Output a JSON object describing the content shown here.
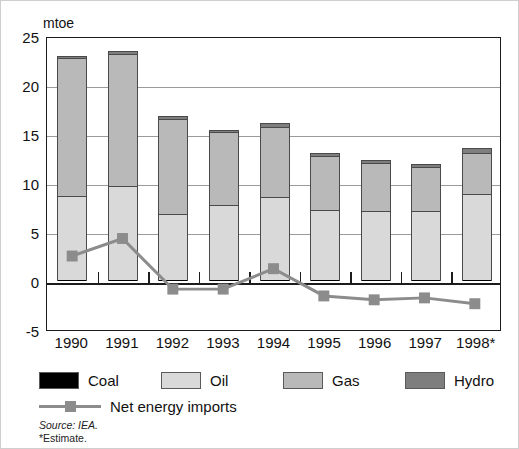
{
  "chart_data": {
    "type": "bar",
    "title": "",
    "subtitle": "",
    "xlabel": "",
    "ylabel": "mtoe",
    "ylim": [
      -5,
      25
    ],
    "yticks": [
      -5,
      0,
      5,
      10,
      15,
      20,
      25
    ],
    "grid": true,
    "stacked": true,
    "legend_position": "bottom",
    "categories": [
      "1990",
      "1991",
      "1992",
      "1993",
      "1994",
      "1995",
      "1996",
      "1997",
      "1998*"
    ],
    "series": [
      {
        "name": "Coal",
        "values": [
          0.1,
          0.1,
          0.1,
          0.1,
          0.1,
          0.1,
          0.1,
          0.1,
          0.1
        ]
      },
      {
        "name": "Oil",
        "values": [
          8.6,
          9.6,
          6.7,
          7.7,
          8.5,
          7.1,
          7.0,
          7.0,
          8.8
        ]
      },
      {
        "name": "Gas",
        "values": [
          14.1,
          13.5,
          9.7,
          7.4,
          7.1,
          5.6,
          4.9,
          4.5,
          4.2
        ]
      },
      {
        "name": "Hydro",
        "values": [
          0.2,
          0.3,
          0.3,
          0.2,
          0.4,
          0.3,
          0.3,
          0.3,
          0.5
        ]
      }
    ],
    "totals": [
      23.0,
      23.5,
      16.8,
      15.4,
      16.1,
      13.1,
      12.3,
      11.9,
      13.6
    ],
    "line_series": {
      "name": "Net energy imports",
      "values": [
        2.6,
        4.4,
        -0.8,
        -0.8,
        1.3,
        -1.5,
        -1.9,
        -1.7,
        -2.3
      ]
    },
    "series_colors": {
      "Coal": "#000000",
      "Oil": "#d9d9d9",
      "Gas": "#b9b9b9",
      "Hydro": "#7e7e7e",
      "Net energy imports": "#8c8c8c"
    }
  },
  "axis": {
    "unit_label": "mtoe",
    "y_tick_labels": [
      "25",
      "20",
      "15",
      "10",
      "5",
      "0",
      "-5"
    ],
    "x_tick_labels": [
      "1990",
      "1991",
      "1992",
      "1993",
      "1994",
      "1995",
      "1996",
      "1997",
      "1998*"
    ]
  },
  "legend": {
    "items": [
      {
        "label": "Coal",
        "color": "#000000"
      },
      {
        "label": "Oil",
        "color": "#d9d9d9"
      },
      {
        "label": "Gas",
        "color": "#b9b9b9"
      },
      {
        "label": "Hydro",
        "color": "#7e7e7e"
      }
    ],
    "line_item": {
      "label": "Net energy imports",
      "color": "#8c8c8c"
    }
  },
  "notes": {
    "source": "Source: IEA.",
    "estimate": "*Estimate."
  }
}
